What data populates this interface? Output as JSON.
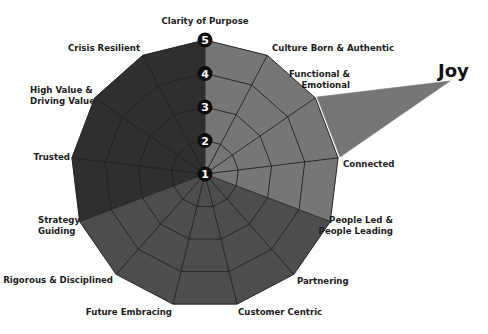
{
  "chart_data": {
    "type": "radar",
    "title": "",
    "center": [
      205,
      174
    ],
    "radius_max": 134,
    "levels": [
      "1",
      "2",
      "3",
      "4",
      "5"
    ],
    "level_range": [
      1,
      5
    ],
    "axes": [
      {
        "label": [
          "Clarity of Purpose"
        ],
        "value": 5,
        "lx": 205,
        "ly": 24,
        "anchor": "middle"
      },
      {
        "label": [
          "Culture Born & Authentic"
        ],
        "value": 5,
        "lx": 272,
        "ly": 51,
        "anchor": "start"
      },
      {
        "label": [
          "Functional &",
          "Emotional"
        ],
        "value": 5,
        "lx": 350,
        "ly": 77,
        "anchor": "end"
      },
      {
        "label": [
          "Connected"
        ],
        "value": 5,
        "lx": 343,
        "ly": 167,
        "anchor": "start"
      },
      {
        "label": [
          "People Led &",
          "People Leading"
        ],
        "value": 5,
        "lx": 393,
        "ly": 223,
        "anchor": "end"
      },
      {
        "label": [
          "Partnering"
        ],
        "value": 5,
        "lx": 297,
        "ly": 284,
        "anchor": "start"
      },
      {
        "label": [
          "Customer Centric"
        ],
        "value": 5,
        "lx": 238,
        "ly": 315,
        "anchor": "start"
      },
      {
        "label": [
          "Future Embracing"
        ],
        "value": 5,
        "lx": 172,
        "ly": 315,
        "anchor": "end"
      },
      {
        "label": [
          "Rigorous & Disciplined"
        ],
        "value": 5,
        "lx": 113,
        "ly": 283,
        "anchor": "end"
      },
      {
        "label": [
          "Strategy",
          "Guiding"
        ],
        "value": 5,
        "lx": 38,
        "ly": 223,
        "anchor": "start"
      },
      {
        "label": [
          "Trusted"
        ],
        "value": 5,
        "lx": 70,
        "ly": 160,
        "anchor": "end"
      },
      {
        "label": [
          "High Value &",
          "Driving Value"
        ],
        "value": 5,
        "lx": 30,
        "ly": 93,
        "anchor": "start"
      },
      {
        "label": [
          "Crisis Resilient"
        ],
        "value": 5,
        "lx": 140,
        "ly": 51,
        "anchor": "end"
      }
    ],
    "sectors": [
      {
        "name": "upper-left",
        "from_axis": 9,
        "to_axis": 13,
        "color": "#2f2f2f"
      },
      {
        "name": "bottom",
        "from_axis": 4,
        "to_axis": 9,
        "color": "#4d4d4d"
      },
      {
        "name": "upper-right",
        "from_axis": 0,
        "to_axis": 4,
        "color": "#767676"
      }
    ],
    "annotation": {
      "label": "Joy",
      "tip": [
        450,
        81
      ],
      "base_from": [
        317,
        97
      ],
      "base_to": [
        340,
        157
      ],
      "label_x": 438,
      "label_y": 77,
      "color": "#767676"
    },
    "grid": true,
    "legend": null
  }
}
